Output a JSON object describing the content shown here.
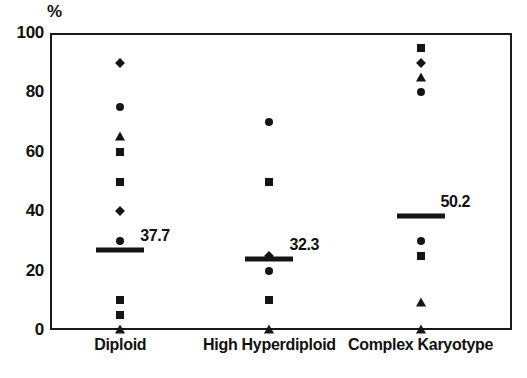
{
  "chart_data": {
    "type": "scatter",
    "title": "",
    "subtitle": "",
    "xlabel": "",
    "ylabel": "%",
    "ylim": [
      0,
      100
    ],
    "yticks": [
      0,
      20,
      40,
      60,
      80,
      100
    ],
    "grid": false,
    "legend": false,
    "categories": [
      "Diploid",
      "High Hyperdiploid",
      "Complex Karyotype"
    ],
    "series": [
      {
        "name": "Diploid",
        "category": "Diploid",
        "mean": 37.7,
        "mean_label": "37.7",
        "points": [
          {
            "value": 90,
            "marker": "diamond"
          },
          {
            "value": 75,
            "marker": "circle"
          },
          {
            "value": 65,
            "marker": "triangle"
          },
          {
            "value": 60,
            "marker": "square"
          },
          {
            "value": 50,
            "marker": "square"
          },
          {
            "value": 40,
            "marker": "diamond"
          },
          {
            "value": 30,
            "marker": "circle"
          },
          {
            "value": 10,
            "marker": "square"
          },
          {
            "value": 5,
            "marker": "square"
          },
          {
            "value": 0,
            "marker": "triangle"
          }
        ]
      },
      {
        "name": "High Hyperdiploid",
        "category": "High Hyperdiploid",
        "mean": 32.3,
        "mean_label": "32.3",
        "points": [
          {
            "value": 70,
            "marker": "circle"
          },
          {
            "value": 50,
            "marker": "square"
          },
          {
            "value": 25,
            "marker": "diamond"
          },
          {
            "value": 20,
            "marker": "circle"
          },
          {
            "value": 10,
            "marker": "square"
          },
          {
            "value": 0,
            "marker": "triangle"
          }
        ]
      },
      {
        "name": "Complex Karyotype",
        "category": "Complex Karyotype",
        "mean": 50.2,
        "mean_label": "50.2",
        "points": [
          {
            "value": 95,
            "marker": "square"
          },
          {
            "value": 90,
            "marker": "diamond"
          },
          {
            "value": 85,
            "marker": "triangle"
          },
          {
            "value": 80,
            "marker": "circle"
          },
          {
            "value": 30,
            "marker": "circle"
          },
          {
            "value": 25,
            "marker": "square"
          },
          {
            "value": 9,
            "marker": "triangle"
          },
          {
            "value": 0,
            "marker": "triangle"
          }
        ]
      }
    ],
    "mean_bar_positions": [
      27,
      24,
      38.5
    ],
    "colors": {
      "marker": "#151515",
      "axis": "#1a1a1a",
      "text": "#111111",
      "background": "#ffffff"
    }
  }
}
